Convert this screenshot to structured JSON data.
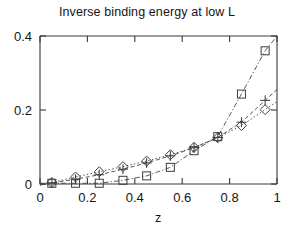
{
  "chart_data": {
    "type": "scatter",
    "title": "Inverse binding energy at low L",
    "xlabel": "z",
    "ylabel": "",
    "xlim": [
      0,
      1
    ],
    "ylim": [
      0,
      0.4
    ],
    "grid": false,
    "legend": "none",
    "xticks": [
      "0",
      "0.2",
      "0.4",
      "0.6",
      "0.8",
      "1"
    ],
    "xtick_values": [
      0,
      0.2,
      0.4,
      0.6,
      0.8,
      1
    ],
    "yticks": [
      "0",
      "0.2",
      "0.4"
    ],
    "ytick_values": [
      0,
      0.2,
      0.4
    ],
    "x": [
      0.05,
      0.15,
      0.25,
      0.35,
      0.45,
      0.55,
      0.65,
      0.75,
      0.85,
      0.95
    ],
    "series": [
      {
        "name": "diamond-series",
        "marker": "diamond",
        "linestyle": "dotted",
        "values": [
          0.004,
          0.019,
          0.033,
          0.047,
          0.062,
          0.079,
          0.099,
          0.125,
          0.158,
          0.201
        ]
      },
      {
        "name": "plus-series",
        "marker": "plus",
        "linestyle": "dashed",
        "values": [
          0.003,
          0.013,
          0.025,
          0.04,
          0.057,
          0.076,
          0.098,
          0.126,
          0.167,
          0.226
        ]
      },
      {
        "name": "square-series",
        "marker": "square",
        "linestyle": "dash-dot",
        "values": [
          0.002,
          0.002,
          0.002,
          0.01,
          0.022,
          0.045,
          0.09,
          0.128,
          0.243,
          0.36
        ]
      }
    ],
    "colors": {
      "axis": "#3a3a3a",
      "line": "#444444",
      "marker": "#3d3d3d",
      "text": "#151515",
      "background": "#ffffff"
    }
  }
}
